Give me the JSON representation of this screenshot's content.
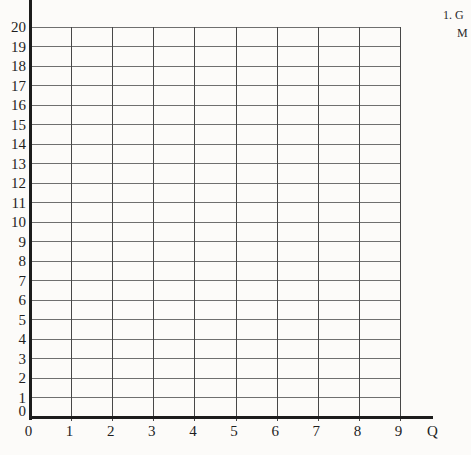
{
  "annotation": {
    "line1": "1. G",
    "line2": "M"
  },
  "chart_data": {
    "type": "line",
    "title": "",
    "xlabel": "Q",
    "ylabel": "",
    "x_ticks": [
      0,
      1,
      2,
      3,
      4,
      5,
      6,
      7,
      8,
      9
    ],
    "y_ticks": [
      0,
      1,
      2,
      3,
      4,
      5,
      6,
      7,
      8,
      9,
      10,
      11,
      12,
      13,
      14,
      15,
      16,
      17,
      18,
      19,
      20
    ],
    "xlim": [
      0,
      9
    ],
    "ylim": [
      0,
      20
    ],
    "grid": true,
    "legend_position": "none",
    "series": []
  },
  "colors": {
    "axis": "#1c1c1c",
    "grid_horizontal": "#6f6f6f",
    "grid_vertical": "#474747",
    "text": "#1e1e1e",
    "background": "#fcfbf9"
  }
}
